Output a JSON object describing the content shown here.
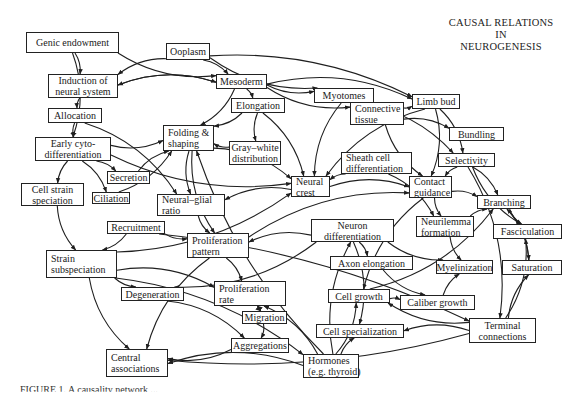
{
  "title": {
    "lines": [
      "CAUSAL RELATIONS",
      "IN",
      "NEUROGENESIS"
    ]
  },
  "caption": "FIGURE 1.   A causality network ...",
  "style": {
    "line_color": "#1f1f1f",
    "box_border": "#222222",
    "background": "#ffffff"
  },
  "nodes": [
    {
      "id": "genic",
      "lines": [
        "Genic endowment"
      ],
      "x": 26,
      "y": 32,
      "w": 93,
      "h": 21,
      "align": "center"
    },
    {
      "id": "ooplasm",
      "lines": [
        "Ooplasm"
      ],
      "x": 166,
      "y": 43,
      "w": 44,
      "h": 17,
      "align": "center"
    },
    {
      "id": "induction",
      "lines": [
        "Induction of",
        "neural system"
      ],
      "x": 48,
      "y": 74,
      "w": 70,
      "h": 24,
      "align": "center"
    },
    {
      "id": "mesoderm",
      "lines": [
        "Mesoderm"
      ],
      "x": 216,
      "y": 74,
      "w": 51,
      "h": 15,
      "align": "center"
    },
    {
      "id": "allocation",
      "lines": [
        "Allocation"
      ],
      "x": 48,
      "y": 108,
      "w": 54,
      "h": 15,
      "align": "center"
    },
    {
      "id": "elongation",
      "lines": [
        "Elongation"
      ],
      "x": 231,
      "y": 98,
      "w": 54,
      "h": 15,
      "align": "center"
    },
    {
      "id": "myotomes",
      "lines": [
        "Myotomes"
      ],
      "x": 314,
      "y": 88,
      "w": 60,
      "h": 15,
      "align": "center"
    },
    {
      "id": "connective",
      "lines": [
        "Connective",
        "tissue"
      ],
      "x": 350,
      "y": 102,
      "w": 54,
      "h": 23,
      "align": "left"
    },
    {
      "id": "limbbud",
      "lines": [
        "Limb bud"
      ],
      "x": 412,
      "y": 94,
      "w": 48,
      "h": 15,
      "align": "center"
    },
    {
      "id": "bundling",
      "lines": [
        "Bundling"
      ],
      "x": 449,
      "y": 127,
      "w": 55,
      "h": 14,
      "align": "center"
    },
    {
      "id": "earlycyto",
      "lines": [
        "Early cyto-",
        "differentiation"
      ],
      "x": 35,
      "y": 137,
      "w": 76,
      "h": 24,
      "align": "center"
    },
    {
      "id": "folding",
      "lines": [
        "Folding &",
        "shaping"
      ],
      "x": 163,
      "y": 125,
      "w": 51,
      "h": 26,
      "align": "left"
    },
    {
      "id": "graywhite",
      "lines": [
        "Gray–white",
        "distribution"
      ],
      "x": 229,
      "y": 141,
      "w": 52,
      "h": 24,
      "align": "center"
    },
    {
      "id": "secretion",
      "lines": [
        "Secretion"
      ],
      "x": 107,
      "y": 171,
      "w": 43,
      "h": 13,
      "align": "center"
    },
    {
      "id": "sheath",
      "lines": [
        "Sheath cell",
        "differentiation"
      ],
      "x": 341,
      "y": 152,
      "w": 71,
      "h": 22,
      "align": "left"
    },
    {
      "id": "selectivity",
      "lines": [
        "Selectivity"
      ],
      "x": 438,
      "y": 153,
      "w": 57,
      "h": 14,
      "align": "center"
    },
    {
      "id": "cellstrain",
      "lines": [
        "Cell strain",
        "speciation"
      ],
      "x": 21,
      "y": 183,
      "w": 63,
      "h": 23,
      "align": "center"
    },
    {
      "id": "ciliation",
      "lines": [
        "Ciliation"
      ],
      "x": 92,
      "y": 192,
      "w": 38,
      "h": 12,
      "align": "center"
    },
    {
      "id": "neuralglial",
      "lines": [
        "Neural–glial",
        "ratio"
      ],
      "x": 157,
      "y": 194,
      "w": 68,
      "h": 22,
      "align": "left"
    },
    {
      "id": "neuralcrest",
      "lines": [
        "Neural",
        "crest"
      ],
      "x": 291,
      "y": 176,
      "w": 39,
      "h": 21,
      "align": "left"
    },
    {
      "id": "contact",
      "lines": [
        "Contact",
        "guidance"
      ],
      "x": 409,
      "y": 176,
      "w": 43,
      "h": 22,
      "align": "left"
    },
    {
      "id": "branching",
      "lines": [
        "Branching"
      ],
      "x": 477,
      "y": 195,
      "w": 54,
      "h": 14,
      "align": "center"
    },
    {
      "id": "recruitment",
      "lines": [
        "Recruitment"
      ],
      "x": 107,
      "y": 221,
      "w": 58,
      "h": 13,
      "align": "center"
    },
    {
      "id": "prolpattern",
      "lines": [
        "Proliferation",
        "pattern"
      ],
      "x": 187,
      "y": 233,
      "w": 62,
      "h": 25,
      "align": "left"
    },
    {
      "id": "neurondiff",
      "lines": [
        "Neuron",
        "differentiation"
      ],
      "x": 311,
      "y": 219,
      "w": 83,
      "h": 23,
      "align": "center"
    },
    {
      "id": "neurilemma",
      "lines": [
        "Neurilemma",
        "formation"
      ],
      "x": 416,
      "y": 216,
      "w": 58,
      "h": 21,
      "align": "left"
    },
    {
      "id": "fasciculation",
      "lines": [
        "Fasciculation"
      ],
      "x": 493,
      "y": 224,
      "w": 69,
      "h": 15,
      "align": "center"
    },
    {
      "id": "strainsub",
      "lines": [
        "Strain",
        "subspeciation"
      ],
      "x": 46,
      "y": 250,
      "w": 71,
      "h": 28,
      "align": "left"
    },
    {
      "id": "axonelong",
      "lines": [
        "Axon elongation"
      ],
      "x": 330,
      "y": 256,
      "w": 83,
      "h": 14,
      "align": "center"
    },
    {
      "id": "myelin",
      "lines": [
        "Myelinization"
      ],
      "x": 436,
      "y": 260,
      "w": 57,
      "h": 14,
      "align": "center"
    },
    {
      "id": "saturation",
      "lines": [
        "Saturation"
      ],
      "x": 502,
      "y": 260,
      "w": 60,
      "h": 15,
      "align": "center"
    },
    {
      "id": "degeneration",
      "lines": [
        "Degeneration"
      ],
      "x": 121,
      "y": 287,
      "w": 63,
      "h": 14,
      "align": "center"
    },
    {
      "id": "prolrate",
      "lines": [
        "Proliferation",
        "rate"
      ],
      "x": 214,
      "y": 281,
      "w": 72,
      "h": 25,
      "align": "left"
    },
    {
      "id": "migration",
      "lines": [
        "Migration"
      ],
      "x": 242,
      "y": 311,
      "w": 45,
      "h": 13,
      "align": "center"
    },
    {
      "id": "cellgrowth",
      "lines": [
        "Cell growth"
      ],
      "x": 328,
      "y": 289,
      "w": 62,
      "h": 14,
      "align": "center"
    },
    {
      "id": "caliber",
      "lines": [
        "Caliber growth"
      ],
      "x": 400,
      "y": 295,
      "w": 75,
      "h": 15,
      "align": "center"
    },
    {
      "id": "terminal",
      "lines": [
        "Terminal",
        "connections"
      ],
      "x": 469,
      "y": 318,
      "w": 67,
      "h": 25,
      "align": "center"
    },
    {
      "id": "cellspec",
      "lines": [
        "Cell specialization"
      ],
      "x": 316,
      "y": 324,
      "w": 88,
      "h": 14,
      "align": "center"
    },
    {
      "id": "aggregations",
      "lines": [
        "Aggregations"
      ],
      "x": 231,
      "y": 338,
      "w": 58,
      "h": 15,
      "align": "center"
    },
    {
      "id": "central",
      "lines": [
        "Central",
        "associations"
      ],
      "x": 106,
      "y": 349,
      "w": 62,
      "h": 28,
      "align": "left"
    },
    {
      "id": "hormones",
      "lines": [
        "Hormones",
        "(e.g. thyroid)"
      ],
      "x": 303,
      "y": 354,
      "w": 56,
      "h": 24,
      "align": "left"
    }
  ],
  "edges": [
    {
      "from": "genic",
      "to": "induction"
    },
    {
      "from": "genic",
      "to": "mesoderm"
    },
    {
      "from": "genic",
      "to": "earlycyto"
    },
    {
      "from": "ooplasm",
      "to": "induction"
    },
    {
      "from": "ooplasm",
      "to": "mesoderm"
    },
    {
      "from": "ooplasm",
      "to": "myotomes"
    },
    {
      "from": "ooplasm",
      "to": "limbbud"
    },
    {
      "from": "induction",
      "to": "allocation"
    },
    {
      "from": "induction",
      "to": "mesoderm"
    },
    {
      "from": "mesoderm",
      "to": "induction"
    },
    {
      "from": "mesoderm",
      "to": "elongation"
    },
    {
      "from": "mesoderm",
      "to": "myotomes"
    },
    {
      "from": "mesoderm",
      "to": "folding"
    },
    {
      "from": "mesoderm",
      "to": "connective"
    },
    {
      "from": "mesoderm",
      "to": "limbbud"
    },
    {
      "from": "allocation",
      "to": "earlycyto"
    },
    {
      "from": "allocation",
      "to": "neuralglial"
    },
    {
      "from": "earlycyto",
      "to": "folding"
    },
    {
      "from": "earlycyto",
      "to": "secretion"
    },
    {
      "from": "earlycyto",
      "to": "cellstrain"
    },
    {
      "from": "earlycyto",
      "to": "ciliation"
    },
    {
      "from": "earlycyto",
      "to": "neuralcrest"
    },
    {
      "from": "secretion",
      "to": "folding"
    },
    {
      "from": "ciliation",
      "to": "folding"
    },
    {
      "from": "elongation",
      "to": "folding"
    },
    {
      "from": "elongation",
      "to": "graywhite"
    },
    {
      "from": "elongation",
      "to": "neuralcrest"
    },
    {
      "from": "myotomes",
      "to": "neuralcrest"
    },
    {
      "from": "myotomes",
      "to": "selectivity"
    },
    {
      "from": "connective",
      "to": "limbbud"
    },
    {
      "from": "connective",
      "to": "bundling"
    },
    {
      "from": "connective",
      "to": "contact"
    },
    {
      "from": "limbbud",
      "to": "selectivity"
    },
    {
      "from": "limbbud",
      "to": "neuralcrest"
    },
    {
      "from": "limbbud",
      "to": "contact"
    },
    {
      "from": "folding",
      "to": "neuralglial"
    },
    {
      "from": "folding",
      "to": "neuralcrest"
    },
    {
      "from": "folding",
      "to": "prolpattern"
    },
    {
      "from": "graywhite",
      "to": "folding"
    },
    {
      "from": "sheath",
      "to": "neuralcrest"
    },
    {
      "from": "sheath",
      "to": "neurilemma"
    },
    {
      "from": "selectivity",
      "to": "contact"
    },
    {
      "from": "selectivity",
      "to": "branching"
    },
    {
      "from": "selectivity",
      "to": "fasciculation"
    },
    {
      "from": "selectivity",
      "to": "terminal"
    },
    {
      "from": "neuralcrest",
      "to": "neuralglial"
    },
    {
      "from": "neuralcrest",
      "to": "contact"
    },
    {
      "from": "cellstrain",
      "to": "strainsub"
    },
    {
      "from": "recruitment",
      "to": "strainsub"
    },
    {
      "from": "recruitment",
      "to": "prolpattern"
    },
    {
      "from": "recruitment",
      "to": "terminal"
    },
    {
      "from": "neuralglial",
      "to": "prolpattern"
    },
    {
      "from": "prolpattern",
      "to": "prolrate"
    },
    {
      "from": "prolpattern",
      "to": "central"
    },
    {
      "from": "prolpattern",
      "to": "contact"
    },
    {
      "from": "contact",
      "to": "neurilemma"
    },
    {
      "from": "contact",
      "to": "branching"
    },
    {
      "from": "contact",
      "to": "cellgrowth"
    },
    {
      "from": "neurondiff",
      "to": "axonelong"
    },
    {
      "from": "neurondiff",
      "to": "myelin"
    },
    {
      "from": "neurondiff",
      "to": "cellspec"
    },
    {
      "from": "neurilemma",
      "to": "myelin"
    },
    {
      "from": "neurilemma",
      "to": "branching"
    },
    {
      "from": "branching",
      "to": "fasciculation"
    },
    {
      "from": "branching",
      "to": "saturation"
    },
    {
      "from": "saturation",
      "to": "branching"
    },
    {
      "from": "terminal",
      "to": "saturation"
    },
    {
      "from": "terminal",
      "to": "fasciculation"
    },
    {
      "from": "terminal",
      "to": "cellgrowth"
    },
    {
      "from": "terminal",
      "to": "cellspec"
    },
    {
      "from": "terminal",
      "to": "central"
    },
    {
      "from": "axonelong",
      "to": "caliber"
    },
    {
      "from": "cellgrowth",
      "to": "caliber"
    },
    {
      "from": "cellgrowth",
      "to": "branching"
    },
    {
      "from": "caliber",
      "to": "myelin"
    },
    {
      "from": "strainsub",
      "to": "degeneration"
    },
    {
      "from": "strainsub",
      "to": "prolrate"
    },
    {
      "from": "strainsub",
      "to": "central"
    },
    {
      "from": "strainsub",
      "to": "hormones"
    },
    {
      "from": "strainsub",
      "to": "neuralcrest"
    },
    {
      "from": "degeneration",
      "to": "aggregations"
    },
    {
      "from": "prolrate",
      "to": "migration"
    },
    {
      "from": "migration",
      "to": "aggregations"
    },
    {
      "from": "migration",
      "to": "prolrate"
    },
    {
      "from": "aggregations",
      "to": "central"
    },
    {
      "from": "hormones",
      "to": "central"
    },
    {
      "from": "hormones",
      "to": "cellspec"
    },
    {
      "from": "hormones",
      "to": "cellgrowth"
    },
    {
      "from": "hormones",
      "to": "neurondiff"
    },
    {
      "from": "hormones",
      "to": "prolrate"
    },
    {
      "from": "hormones",
      "to": "folding"
    },
    {
      "from": "neurondiff",
      "to": "prolpattern"
    },
    {
      "from": "neurondiff",
      "to": "degeneration"
    }
  ]
}
